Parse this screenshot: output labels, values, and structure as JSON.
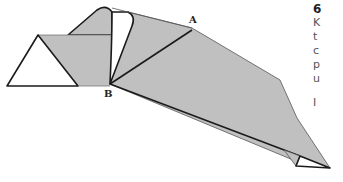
{
  "diagram": {
    "type": "origami-fold-step",
    "labels": {
      "point_a": "A",
      "point_b": "B"
    },
    "colors": {
      "shade": "#c0c0c0",
      "line": "#1a1a1a",
      "paper": "#ffffff"
    }
  },
  "instructions": {
    "step_number": "6",
    "lines": [
      "K",
      "t",
      "c",
      "p",
      "u"
    ],
    "next_paragraph": "I"
  }
}
